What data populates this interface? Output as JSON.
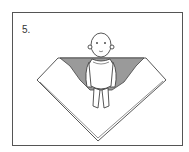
{
  "illustration": {
    "step_label": "5.",
    "subject": "baby lying on blanket folded into swaddle shape",
    "colors": {
      "line": "#444444",
      "fold_shade": "#9a9a9a",
      "background": "#ffffff"
    }
  }
}
